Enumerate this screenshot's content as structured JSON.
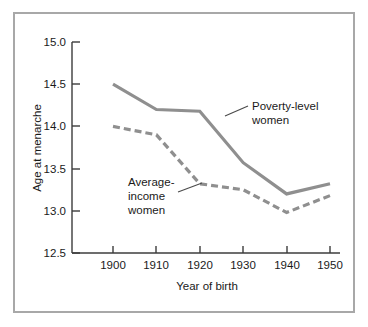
{
  "chart_data": {
    "type": "line",
    "title": "",
    "xlabel": "Year of birth",
    "ylabel": "Age at menarche",
    "x": [
      1900,
      1910,
      1920,
      1930,
      1940,
      1950
    ],
    "xtick_labels": [
      "1900",
      "1910",
      "1920",
      "1930",
      "1940",
      "1950"
    ],
    "ytick_labels": [
      "12.5",
      "13.0",
      "13.5",
      "14.0",
      "14.5",
      "15.0"
    ],
    "yticks": [
      12.5,
      13.0,
      13.5,
      14.0,
      14.5,
      15.0
    ],
    "xlim": [
      1895,
      1955
    ],
    "ylim": [
      12.5,
      15.0
    ],
    "grid": false,
    "legend_position": "inline-annotations",
    "series": [
      {
        "name": "Poverty-level women",
        "style": "solid",
        "color": "#8f8f8f",
        "values": [
          14.5,
          14.2,
          14.18,
          13.57,
          13.2,
          13.32
        ]
      },
      {
        "name": "Average-income women",
        "style": "dashed",
        "color": "#8f8f8f",
        "values": [
          14.0,
          13.9,
          13.32,
          13.25,
          12.98,
          13.18
        ]
      }
    ],
    "annotations": [
      {
        "id": "poverty",
        "lines": [
          "Poverty-level",
          "women"
        ],
        "text": "Poverty-level women"
      },
      {
        "id": "average",
        "lines": [
          "Average-",
          "income",
          "women"
        ],
        "text": "Average-income women"
      }
    ]
  },
  "axis": {
    "y_title": "Age at menarche",
    "x_title": "Year of birth"
  },
  "ylabels": {
    "v0": "12.5",
    "v1": "13.0",
    "v2": "13.5",
    "v3": "14.0",
    "v4": "14.5",
    "v5": "15.0"
  },
  "xlabels": {
    "v0": "1900",
    "v1": "1910",
    "v2": "1920",
    "v3": "1930",
    "v4": "1940",
    "v5": "1950"
  },
  "annotations": {
    "poverty_l1": "Poverty-level",
    "poverty_l2": "women",
    "average_l1": "Average-",
    "average_l2": "income",
    "average_l3": "women"
  },
  "colors": {
    "series": "#8f8f8f",
    "axis": "#3c3c3c",
    "frame": "#a8a8a8",
    "text": "#1a1a1a"
  }
}
